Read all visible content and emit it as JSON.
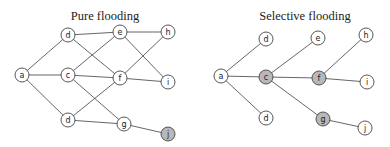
{
  "diagrams": [
    {
      "title": "Pure flooding",
      "title_pos": [
        105,
        16
      ],
      "nodes": [
        {
          "id": "a",
          "label": "a",
          "x": 22,
          "y": 75,
          "shaded": false
        },
        {
          "id": "d1",
          "label": "d",
          "x": 68,
          "y": 35,
          "shaded": false
        },
        {
          "id": "c",
          "label": "c",
          "x": 68,
          "y": 75,
          "shaded": false
        },
        {
          "id": "d2",
          "label": "d",
          "x": 68,
          "y": 120,
          "shaded": false
        },
        {
          "id": "e",
          "label": "e",
          "x": 120,
          "y": 32,
          "shaded": false
        },
        {
          "id": "f",
          "label": "f",
          "x": 120,
          "y": 78,
          "shaded": false
        },
        {
          "id": "g",
          "label": "g",
          "x": 124,
          "y": 124,
          "shaded": false
        },
        {
          "id": "h",
          "label": "h",
          "x": 168,
          "y": 32,
          "shaded": false
        },
        {
          "id": "i",
          "label": "i",
          "x": 168,
          "y": 82,
          "shaded": false
        },
        {
          "id": "j",
          "label": "j",
          "x": 168,
          "y": 134,
          "shaded": true
        }
      ],
      "edges": [
        [
          "a",
          "d1"
        ],
        [
          "a",
          "c"
        ],
        [
          "a",
          "d2"
        ],
        [
          "d1",
          "e"
        ],
        [
          "d1",
          "f"
        ],
        [
          "c",
          "e"
        ],
        [
          "c",
          "f"
        ],
        [
          "c",
          "g"
        ],
        [
          "d2",
          "f"
        ],
        [
          "d2",
          "g"
        ],
        [
          "e",
          "h"
        ],
        [
          "e",
          "i"
        ],
        [
          "f",
          "h"
        ],
        [
          "f",
          "i"
        ],
        [
          "g",
          "j"
        ]
      ]
    },
    {
      "title": "Selective flooding",
      "title_pos": [
        305,
        16
      ],
      "nodes": [
        {
          "id": "a",
          "label": "a",
          "x": 221,
          "y": 76,
          "shaded": false
        },
        {
          "id": "d1",
          "label": "d",
          "x": 266,
          "y": 39,
          "shaded": false
        },
        {
          "id": "c",
          "label": "c",
          "x": 266,
          "y": 77,
          "shaded": true
        },
        {
          "id": "d2",
          "label": "d",
          "x": 266,
          "y": 118,
          "shaded": false
        },
        {
          "id": "e",
          "label": "e",
          "x": 318,
          "y": 38,
          "shaded": false
        },
        {
          "id": "f",
          "label": "f",
          "x": 319,
          "y": 78,
          "shaded": true
        },
        {
          "id": "g",
          "label": "g",
          "x": 323,
          "y": 119,
          "shaded": true
        },
        {
          "id": "h",
          "label": "h",
          "x": 366,
          "y": 35,
          "shaded": false
        },
        {
          "id": "i",
          "label": "i",
          "x": 367,
          "y": 82,
          "shaded": false
        },
        {
          "id": "j",
          "label": "j",
          "x": 365,
          "y": 128,
          "shaded": false
        }
      ],
      "edges": [
        [
          "a",
          "d1"
        ],
        [
          "a",
          "c"
        ],
        [
          "a",
          "d2"
        ],
        [
          "c",
          "e"
        ],
        [
          "c",
          "f"
        ],
        [
          "c",
          "g"
        ],
        [
          "f",
          "h"
        ],
        [
          "f",
          "i"
        ],
        [
          "g",
          "j"
        ]
      ]
    }
  ],
  "style": {
    "node_fill": "#ffffff",
    "node_shaded_fill": "#b8b8b8",
    "node_radius": 7
  }
}
